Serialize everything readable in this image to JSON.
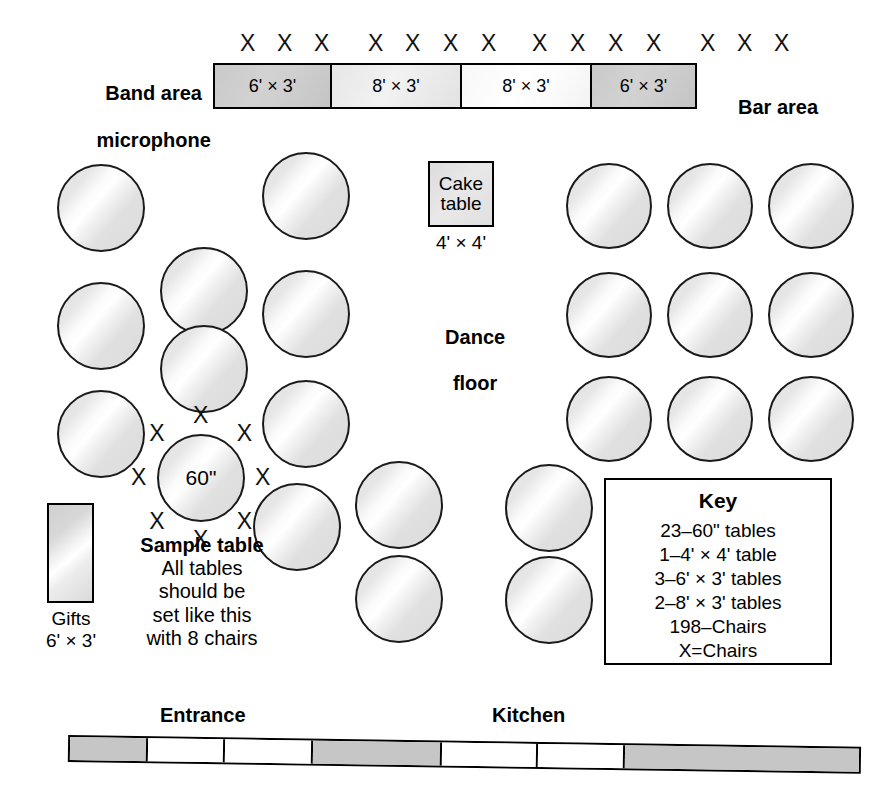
{
  "labels": {
    "band_area_line1": "Band area",
    "band_area_line2": "microphone",
    "bar_area": "Bar area",
    "dance_floor_line1": "Dance",
    "dance_floor_line2": "floor",
    "entrance": "Entrance",
    "kitchen": "Kitchen"
  },
  "band_tables": {
    "cells": [
      {
        "size": "6' × 3'",
        "shade": "fill-dark"
      },
      {
        "size": "8' × 3'",
        "shade": "fill-mid"
      },
      {
        "size": "8' × 3'",
        "shade": "fill-light"
      },
      {
        "size": "6' × 3'",
        "shade": "fill-dark"
      }
    ],
    "chair_mark": "X",
    "chair_groups": [
      3,
      4,
      4,
      3
    ],
    "chair_total": 14
  },
  "cake_table": {
    "line1": "Cake",
    "line2": "table",
    "dimension": "4' × 4'"
  },
  "gifts_table": {
    "name": "Gifts",
    "dimension": "6' × 3'"
  },
  "sample_table": {
    "diameter_label": "60\"",
    "chair_mark": "X",
    "chair_count": 8,
    "caption_heading": "Sample table",
    "caption_line1": "All tables",
    "caption_line2": "should be",
    "caption_line3": "set like this",
    "caption_line4": "with 8 chairs"
  },
  "key": {
    "title": "Key",
    "lines": [
      "23–60\" tables",
      "1–4' × 4' table",
      "3–6' × 3' tables",
      "2–8' × 3' tables",
      "198–Chairs",
      "X=Chairs"
    ]
  },
  "round_tables": [
    {
      "id": "t1",
      "x": 57,
      "y": 164,
      "d": 88
    },
    {
      "id": "t2",
      "x": 262,
      "y": 152,
      "d": 88
    },
    {
      "id": "t3",
      "x": 566,
      "y": 163,
      "d": 86
    },
    {
      "id": "t4",
      "x": 667,
      "y": 163,
      "d": 86
    },
    {
      "id": "t5",
      "x": 768,
      "y": 163,
      "d": 86
    },
    {
      "id": "t6",
      "x": 160,
      "y": 247,
      "d": 88
    },
    {
      "id": "t7",
      "x": 262,
      "y": 270,
      "d": 88
    },
    {
      "id": "t8",
      "x": 57,
      "y": 282,
      "d": 88
    },
    {
      "id": "t9",
      "x": 566,
      "y": 272,
      "d": 86
    },
    {
      "id": "t10",
      "x": 667,
      "y": 272,
      "d": 86
    },
    {
      "id": "t11",
      "x": 768,
      "y": 272,
      "d": 86
    },
    {
      "id": "t12",
      "x": 160,
      "y": 325,
      "d": 88
    },
    {
      "id": "t13",
      "x": 57,
      "y": 390,
      "d": 88
    },
    {
      "id": "t14",
      "x": 262,
      "y": 380,
      "d": 88
    },
    {
      "id": "t15",
      "x": 566,
      "y": 376,
      "d": 86
    },
    {
      "id": "t16",
      "x": 667,
      "y": 376,
      "d": 86
    },
    {
      "id": "t17",
      "x": 768,
      "y": 376,
      "d": 86
    },
    {
      "id": "t18",
      "x": 253,
      "y": 483,
      "d": 88
    },
    {
      "id": "t19",
      "x": 355,
      "y": 461,
      "d": 88
    },
    {
      "id": "t20",
      "x": 505,
      "y": 464,
      "d": 88
    },
    {
      "id": "t21",
      "x": 355,
      "y": 555,
      "d": 88
    },
    {
      "id": "t22",
      "x": 505,
      "y": 556,
      "d": 88
    }
  ],
  "bottom_strip": {
    "segments": [
      {
        "w": 78,
        "shade": "strip-gray"
      },
      {
        "w": 78,
        "shade": "strip-white"
      },
      {
        "w": 88,
        "shade": "strip-white"
      },
      {
        "w": 130,
        "shade": "strip-gray"
      },
      {
        "w": 96,
        "shade": "strip-white"
      },
      {
        "w": 88,
        "shade": "strip-white"
      },
      {
        "w": 235,
        "shade": "strip-gray"
      }
    ]
  }
}
